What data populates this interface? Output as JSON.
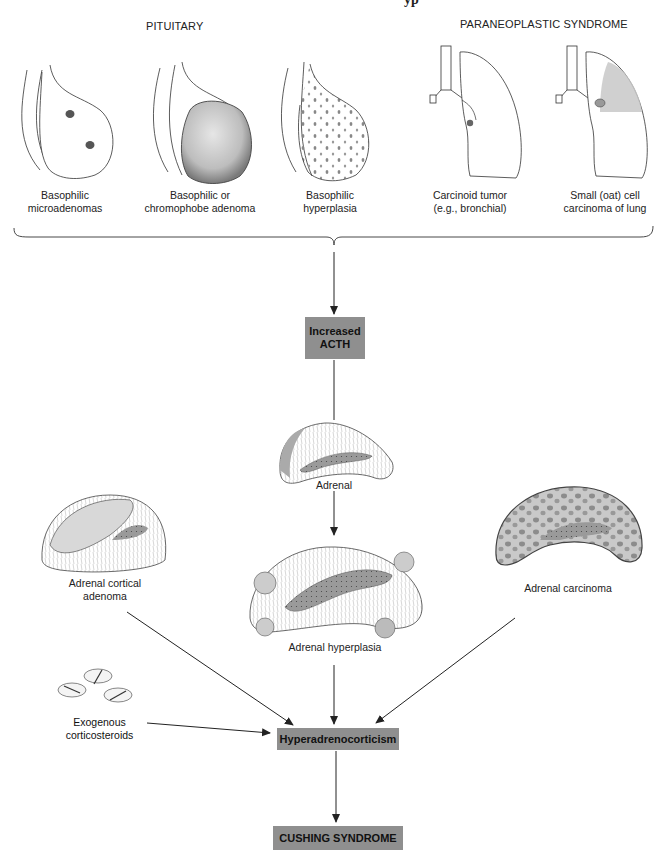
{
  "title_fragment": "yp",
  "headers": {
    "pituitary": "PITUITARY",
    "paraneoplastic": "PARANEOPLASTIC SYNDROME"
  },
  "causes": [
    {
      "line1": "Basophilic",
      "line2": "microadenomas"
    },
    {
      "line1": "Basophilic or",
      "line2": "chromophobe adenoma"
    },
    {
      "line1": "Basophilic",
      "line2": "hyperplasia"
    },
    {
      "line1": "Carcinoid tumor",
      "line2": "(e.g., bronchial)"
    },
    {
      "line1": "Small (oat) cell",
      "line2": "carcinoma of lung"
    }
  ],
  "nodes": {
    "acth": {
      "line1": "Increased",
      "line2": "ACTH"
    },
    "adrenal": "Adrenal",
    "adrenal_cortical_adenoma": {
      "line1": "Adrenal cortical",
      "line2": "adenoma"
    },
    "adrenal_hyperplasia": "Adrenal hyperplasia",
    "adrenal_carcinoma": "Adrenal carcinoma",
    "exogenous": {
      "line1": "Exogenous",
      "line2": "corticosteroids"
    },
    "hyperadrenocorticism": "Hyperadrenocorticism",
    "cushing": "CUSHING SYNDROME"
  },
  "colors": {
    "box_fill": "#8f8f8f",
    "exogenous_fill": "#a3a3a3",
    "line": "#222222"
  }
}
